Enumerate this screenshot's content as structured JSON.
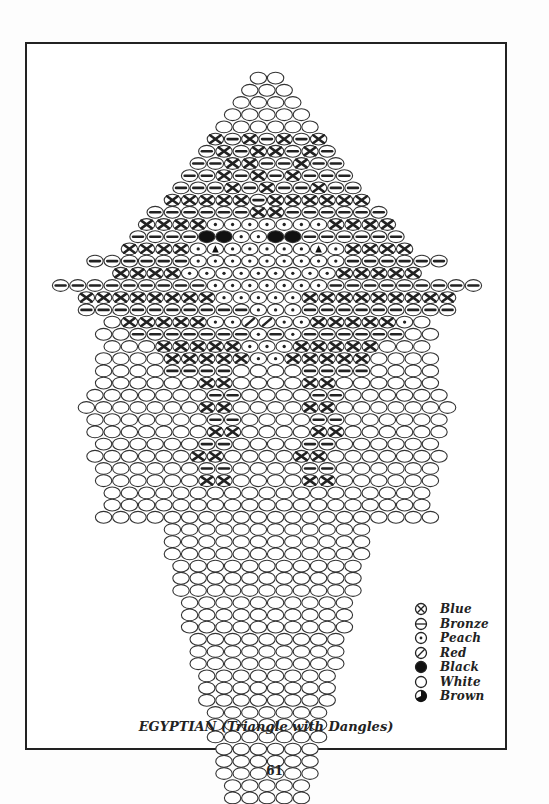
{
  "caption": "EGYPTIAN (Triangle with Dangles)",
  "page_number": "61",
  "legend": [
    {
      "symbol": "x",
      "label": "Blue"
    },
    {
      "symbol": "-",
      "label": "Bronze"
    },
    {
      "symbol": ".",
      "label": "Peach"
    },
    {
      "symbol": "/",
      "label": "Red"
    },
    {
      "symbol": "B",
      "label": "Black"
    },
    {
      "symbol": "o",
      "label": "White"
    },
    {
      "symbol": "b",
      "label": "Brown"
    }
  ],
  "pattern": {
    "bead_w": 17.2,
    "bead_h": 12.2,
    "center_x": 267,
    "top_y": 72,
    "rows": [
      "oo",
      "ooo",
      "oooo",
      "ooooo",
      "oooooo",
      "x-x-x-x",
      "-x-xx-x-",
      "--xx--x--",
      "--x-x-x---",
      "---x-x--x--",
      "xxxxx-xxxxxx",
      "------xx------",
      "xxxx.......xxxx",
      "----BB..BB------",
      "xxxx.b.....b.xxxx",
      "------.........------",
      "xxxx.........xxxxx",
      "---------.......---------",
      "xxxxxxxx.....xxxxxxxxx",
      "----------...---------",
      "oxxxxx..//..xxxxx.o",
      "oo-------.-.------oo",
      "oooxxxxx...xxxxxooo",
      "ooooxxxxx..xxxxxoooo",
      "oooo----oooo----oooo",
      "ooooooxxooooxxoooooo",
      "ooooooo--oooo--oooooo",
      "oooooooxxooooxxooooooo",
      "ooooooo--oooo--oooooo",
      "oooooooxxooooxxoooooo",
      "oooooo--oooo--oooooo",
      "ooooooxxooooxxooooooo",
      "oooooo--oooo--oooooo",
      "ooooooxxooooxxoooooo",
      "ooooooooooooooooooo",
      "ooooooooooooooooooo",
      "oooooooooooooooooooo",
      "oooooooooooo",
      "oooooooooooo",
      "oooooooooooo",
      "ooooooooooo",
      "ooooooooooo",
      "ooooooooooo",
      "oooooooooo",
      "oooooooooo",
      "oooooooooo",
      "ooooooooo",
      "ooooooooo",
      "ooooooooo",
      "oooooooo",
      "oooooooo",
      "oooooooo",
      "ooooooo",
      "ooooooo",
      "ooooooo",
      "oooooo",
      "oooooo",
      "oooooo",
      "ooooo",
      "ooooo",
      "ooooo",
      "oooo",
      "oooo",
      "oooo",
      "ooo",
      "ooo",
      "ooo",
      "oo",
      "oo",
      "oo"
    ]
  }
}
